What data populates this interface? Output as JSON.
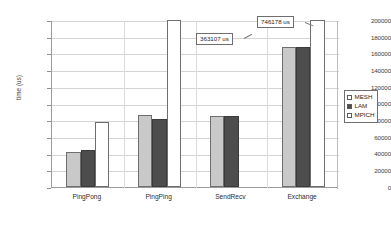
{
  "chart_data": {
    "type": "bar",
    "title": "",
    "xlabel": "",
    "ylabel": "time (us)",
    "ylim": [
      0,
      200000
    ],
    "ytick_step": 20000,
    "grid": true,
    "legend_position": "right",
    "categories": [
      "PingPong",
      "PingPing",
      "SendRecv",
      "Exchange"
    ],
    "ytick_labels": [
      "200000",
      "180000",
      "160000",
      "140000",
      "120000",
      "100000",
      "80000",
      "60000",
      "40000",
      "20000",
      "0"
    ],
    "ytick_values": [
      200000,
      180000,
      160000,
      140000,
      120000,
      100000,
      80000,
      60000,
      40000,
      20000,
      0
    ],
    "series": [
      {
        "name": "MESH",
        "color": "#c9c9c9",
        "values": [
          42500,
          86000,
          85000,
          168000
        ]
      },
      {
        "name": "LAM",
        "color": "#4d4d4d",
        "values": [
          44000,
          82000,
          85000,
          168000
        ]
      },
      {
        "name": "MPICH",
        "color": "#ffffff",
        "values": [
          78000,
          363107,
          null,
          746178
        ]
      }
    ],
    "annotations": [
      {
        "text": "363107 us",
        "series": "MPICH",
        "category": "PingPing"
      },
      {
        "text": "746178 us",
        "series": "MPICH",
        "category": "Exchange"
      }
    ]
  },
  "legend": {
    "items": [
      {
        "label": "MESH"
      },
      {
        "label": "LAM"
      },
      {
        "label": "MPICH"
      }
    ]
  }
}
